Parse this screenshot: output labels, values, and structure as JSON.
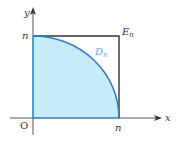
{
  "diagram": {
    "axes": {
      "x_label": "x",
      "y_label": "y",
      "origin_label": "O"
    },
    "ticks": {
      "x_tick_label": "n",
      "y_tick_label": "n"
    },
    "regions": {
      "square": {
        "label_main": "E",
        "label_sub": "n",
        "stroke": "#333333"
      },
      "quarter_disc": {
        "label_main": "D",
        "label_sub": "n",
        "fill": "#c7ebf7",
        "stroke": "#2f7fc8",
        "label_color": "#5aa9dd"
      }
    },
    "colors": {
      "axis": "#555555",
      "text": "#333333"
    }
  }
}
